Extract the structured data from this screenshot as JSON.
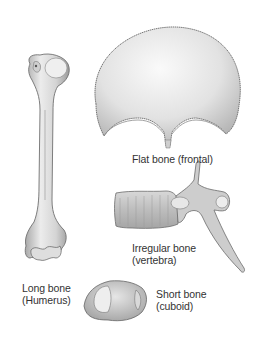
{
  "figure": {
    "colors": {
      "background": "#ffffff",
      "bone_fill": "#e9e9e9",
      "bone_shade": "#b8b8b8",
      "bone_outline": "#6a6a6a",
      "text": "#333333"
    },
    "bones": [
      {
        "id": "long",
        "line1": "Long bone",
        "line2": "(Humerus)"
      },
      {
        "id": "flat",
        "line1": "Flat bone (frontal)",
        "line2": ""
      },
      {
        "id": "irregular",
        "line1": "Irregular bone",
        "line2": "(vertebra)"
      },
      {
        "id": "short",
        "line1": "Short bone",
        "line2": "(cuboid)"
      }
    ]
  }
}
